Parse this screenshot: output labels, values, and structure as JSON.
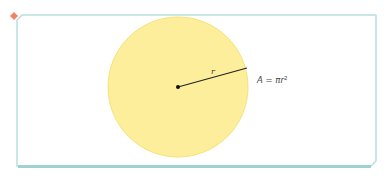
{
  "diagram": {
    "radius_label": "r",
    "formula_label": "A = πr²",
    "formula_parts": {
      "lhs": "A = π",
      "var": "r",
      "exp": "2"
    },
    "colors": {
      "frame": "#b9dfe0",
      "frame_bottom": "#9fd0d3",
      "circle_fill": "#fdee9c",
      "circle_stroke": "#f7e27a",
      "corner_marker": "#f2826a",
      "line": "#222222"
    }
  }
}
